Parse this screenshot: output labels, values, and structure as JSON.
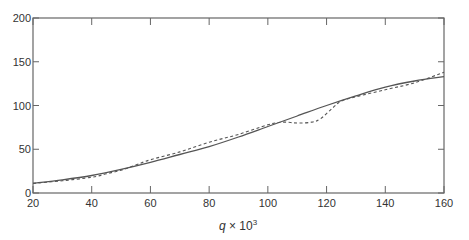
{
  "chart_data": {
    "type": "line",
    "title": "",
    "xlabel": "q × 10³",
    "xlabel_var": "q",
    "xlabel_rest": " × 10",
    "xlabel_sup": "3",
    "ylabel": "",
    "xlim": [
      20,
      160
    ],
    "ylim": [
      0,
      200
    ],
    "xticks": [
      20,
      40,
      60,
      80,
      100,
      120,
      140,
      160
    ],
    "yticks": [
      0,
      50,
      100,
      150,
      200
    ],
    "grid": false,
    "legend": null,
    "series": [
      {
        "name": "solid",
        "style": "solid",
        "color": "#555555",
        "x": [
          20,
          30,
          40,
          50,
          60,
          70,
          80,
          90,
          100,
          110,
          120,
          130,
          140,
          150,
          160
        ],
        "y": [
          11,
          15,
          20,
          27,
          35,
          44,
          53,
          64,
          76,
          88,
          100,
          111,
          121,
          128,
          133
        ]
      },
      {
        "name": "dashed",
        "style": "dashed",
        "color": "#555555",
        "x": [
          20,
          30,
          40,
          45,
          50,
          55,
          60,
          70,
          80,
          90,
          100,
          105,
          110,
          115,
          118,
          122,
          125,
          130,
          140,
          150,
          160
        ],
        "y": [
          11,
          14,
          18,
          22,
          26,
          32,
          38,
          47,
          58,
          67,
          78,
          81,
          80,
          81,
          85,
          97,
          105,
          110,
          118,
          126,
          138
        ]
      }
    ]
  }
}
